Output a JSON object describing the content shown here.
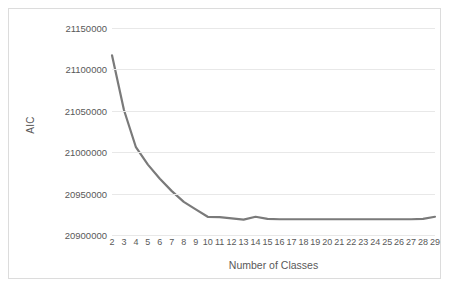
{
  "chart_data": {
    "type": "line",
    "title": "",
    "xlabel": "Number of Classes",
    "ylabel": "AIC",
    "x": [
      2,
      3,
      4,
      5,
      6,
      7,
      8,
      9,
      10,
      11,
      12,
      13,
      14,
      15,
      16,
      17,
      18,
      19,
      20,
      21,
      22,
      23,
      24,
      25,
      26,
      27,
      28,
      29
    ],
    "categories": [
      "2",
      "3",
      "4",
      "5",
      "6",
      "7",
      "8",
      "9",
      "10",
      "11",
      "12",
      "13",
      "14",
      "15",
      "16",
      "17",
      "18",
      "19",
      "20",
      "21",
      "22",
      "23",
      "24",
      "25",
      "26",
      "27",
      "28",
      "29"
    ],
    "series": [
      {
        "name": "AIC",
        "color": "#7a7a7a",
        "values": [
          21117000,
          21051000,
          21006000,
          20985000,
          20968000,
          20953000,
          20940000,
          20931000,
          20922000,
          20921500,
          20920000,
          20918500,
          20922000,
          20919500,
          20919000,
          20919000,
          20919000,
          20919000,
          20919000,
          20919000,
          20919000,
          20919000,
          20919000,
          20919000,
          20919000,
          20919000,
          20919500,
          20922000
        ]
      }
    ],
    "ylim": [
      20900000,
      21150000
    ],
    "yticks": [
      20900000,
      20950000,
      21000000,
      21050000,
      21100000,
      21150000
    ],
    "ytick_labels": [
      "20900000",
      "20950000",
      "21000000",
      "21050000",
      "21100000",
      "21150000"
    ],
    "grid": "horizontal",
    "legend": "none",
    "xlim": [
      2,
      29
    ]
  }
}
